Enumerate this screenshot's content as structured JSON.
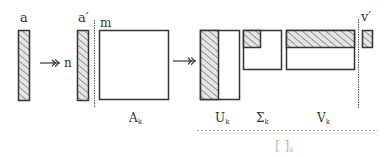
{
  "labels": {
    "a": "a",
    "a_prime": "a′",
    "n": "n",
    "m": "m",
    "v_prime": "v′",
    "A": "A",
    "A_sub": "k",
    "U": "U",
    "U_sub": "k",
    "Sigma": "Σ",
    "Sigma_sub": "k",
    "V": "V",
    "V_sub": "k",
    "bracket": "[ ]",
    "bracket_sub": "k"
  },
  "colors": {
    "stroke": "#333333",
    "hatch": "#555555",
    "hatch_bg": "#e6e6e6",
    "dashed": "#aaaaaa",
    "faded_text": "#b8b8b8"
  }
}
